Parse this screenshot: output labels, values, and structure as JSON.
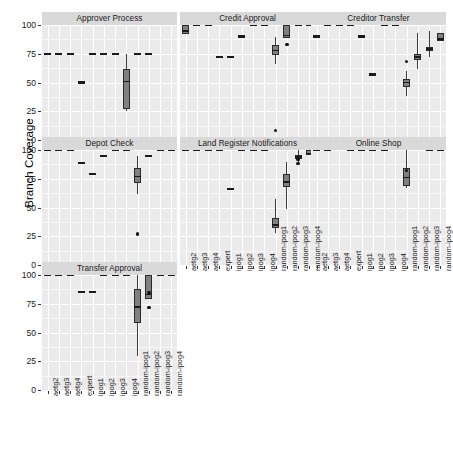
{
  "chart_data": {
    "type": "table",
    "plot_kind": "box",
    "title": "",
    "subtitle": "",
    "xlabel": "",
    "ylabel": "Branch Coverage",
    "ylim": [
      0,
      100
    ],
    "yticks": [
      0,
      25,
      50,
      75,
      100
    ],
    "ytick_labels": [
      "0",
      "25",
      "50",
      "75",
      "100"
    ],
    "grid": true,
    "legend": "none",
    "facet_layout": "3 columns x 3 rows",
    "categories": [
      "aetg2",
      "aetg3",
      "aetg4",
      "expert",
      "ipog1",
      "ipog2",
      "ipog3",
      "ipog4",
      "random-ipog1",
      "random-ipog2",
      "random-ipog3",
      "random-ipog4"
    ],
    "facets": [
      {
        "name": "Approver Process",
        "boxes": [
          {
            "cat": "aetg2",
            "min": 75,
            "q1": 75,
            "med": 75,
            "q3": 75,
            "max": 75,
            "outliers": []
          },
          {
            "cat": "aetg3",
            "min": 75,
            "q1": 75,
            "med": 75,
            "q3": 75,
            "max": 75,
            "outliers": []
          },
          {
            "cat": "aetg4",
            "min": 75,
            "q1": 75,
            "med": 75,
            "q3": 75,
            "max": 75,
            "outliers": []
          },
          {
            "cat": "expert",
            "min": 50,
            "q1": 50,
            "med": 50,
            "q3": 50,
            "max": 50,
            "outliers": []
          },
          {
            "cat": "ipog1",
            "min": 75,
            "q1": 75,
            "med": 75,
            "q3": 75,
            "max": 75,
            "outliers": []
          },
          {
            "cat": "ipog2",
            "min": 75,
            "q1": 75,
            "med": 75,
            "q3": 75,
            "max": 75,
            "outliers": []
          },
          {
            "cat": "ipog3",
            "min": 75,
            "q1": 75,
            "med": 75,
            "q3": 75,
            "max": 75,
            "outliers": []
          },
          {
            "cat": "ipog4",
            "min": 25,
            "q1": 27,
            "med": 51,
            "q3": 62,
            "max": 75,
            "outliers": []
          },
          {
            "cat": "random-ipog1",
            "min": 75,
            "q1": 75,
            "med": 75,
            "q3": 75,
            "max": 75,
            "outliers": []
          },
          {
            "cat": "random-ipog2",
            "min": 75,
            "q1": 75,
            "med": 75,
            "q3": 75,
            "max": 75,
            "outliers": []
          },
          {
            "cat": "random-ipog3",
            "min": null,
            "q1": null,
            "med": null,
            "q3": null,
            "max": null,
            "outliers": []
          },
          {
            "cat": "random-ipog4",
            "min": null,
            "q1": null,
            "med": null,
            "q3": null,
            "max": null,
            "outliers": []
          }
        ]
      },
      {
        "name": "Credit Approval",
        "boxes": [
          {
            "cat": "aetg2",
            "min": 92,
            "q1": 92,
            "med": 95,
            "q3": 100,
            "max": 100,
            "outliers": []
          },
          {
            "cat": "aetg3",
            "min": 100,
            "q1": 100,
            "med": 100,
            "q3": 100,
            "max": 100,
            "outliers": []
          },
          {
            "cat": "aetg4",
            "min": 100,
            "q1": 100,
            "med": 100,
            "q3": 100,
            "max": 100,
            "outliers": []
          },
          {
            "cat": "expert",
            "min": 72,
            "q1": 72,
            "med": 72,
            "q3": 72,
            "max": 72,
            "outliers": []
          },
          {
            "cat": "ipog1",
            "min": 72,
            "q1": 72,
            "med": 72,
            "q3": 72,
            "max": 72,
            "outliers": []
          },
          {
            "cat": "ipog2",
            "min": 90,
            "q1": 90,
            "med": 90,
            "q3": 90,
            "max": 90,
            "outliers": []
          },
          {
            "cat": "ipog3",
            "min": 100,
            "q1": 100,
            "med": 100,
            "q3": 100,
            "max": 100,
            "outliers": []
          },
          {
            "cat": "ipog4",
            "min": 100,
            "q1": 100,
            "med": 100,
            "q3": 100,
            "max": 100,
            "outliers": []
          },
          {
            "cat": "random-ipog1",
            "min": 66,
            "q1": 74,
            "med": 78,
            "q3": 83,
            "max": 90,
            "outliers": [
              8
            ]
          },
          {
            "cat": "random-ipog2",
            "min": 89,
            "q1": 89,
            "med": 91,
            "q3": 100,
            "max": 100,
            "outliers": [
              83
            ]
          },
          {
            "cat": "random-ipog3",
            "min": 100,
            "q1": 100,
            "med": 100,
            "q3": 100,
            "max": 100,
            "outliers": []
          },
          {
            "cat": "random-ipog4",
            "min": 100,
            "q1": 100,
            "med": 100,
            "q3": 100,
            "max": 100,
            "outliers": []
          }
        ]
      },
      {
        "name": "Creditor Transfer",
        "boxes": [
          {
            "cat": "aetg2",
            "min": 90,
            "q1": 90,
            "med": 90,
            "q3": 90,
            "max": 90,
            "outliers": []
          },
          {
            "cat": "aetg3",
            "min": 100,
            "q1": 100,
            "med": 100,
            "q3": 100,
            "max": 100,
            "outliers": []
          },
          {
            "cat": "aetg4",
            "min": 100,
            "q1": 100,
            "med": 100,
            "q3": 100,
            "max": 100,
            "outliers": []
          },
          {
            "cat": "expert",
            "min": 100,
            "q1": 100,
            "med": 100,
            "q3": 100,
            "max": 100,
            "outliers": []
          },
          {
            "cat": "ipog1",
            "min": 90,
            "q1": 90,
            "med": 90,
            "q3": 90,
            "max": 90,
            "outliers": []
          },
          {
            "cat": "ipog2",
            "min": 57,
            "q1": 57,
            "med": 57,
            "q3": 57,
            "max": 57,
            "outliers": []
          },
          {
            "cat": "ipog3",
            "min": 100,
            "q1": 100,
            "med": 100,
            "q3": 100,
            "max": 100,
            "outliers": []
          },
          {
            "cat": "ipog4",
            "min": 100,
            "q1": 100,
            "med": 100,
            "q3": 100,
            "max": 100,
            "outliers": []
          },
          {
            "cat": "random-ipog1",
            "min": 38,
            "q1": 46,
            "med": 50,
            "q3": 53,
            "max": 60,
            "outliers": [
              68
            ]
          },
          {
            "cat": "random-ipog2",
            "min": 62,
            "q1": 70,
            "med": 72,
            "q3": 75,
            "max": 93,
            "outliers": []
          },
          {
            "cat": "random-ipog3",
            "min": 72,
            "q1": 77,
            "med": 79,
            "q3": 81,
            "max": 95,
            "outliers": []
          },
          {
            "cat": "random-ipog4",
            "min": 86,
            "q1": 86,
            "med": 88,
            "q3": 93,
            "max": 93,
            "outliers": []
          }
        ]
      },
      {
        "name": "Depot Check",
        "boxes": [
          {
            "cat": "aetg2",
            "min": 100,
            "q1": 100,
            "med": 100,
            "q3": 100,
            "max": 100,
            "outliers": []
          },
          {
            "cat": "aetg3",
            "min": 100,
            "q1": 100,
            "med": 100,
            "q3": 100,
            "max": 100,
            "outliers": []
          },
          {
            "cat": "aetg4",
            "min": 100,
            "q1": 100,
            "med": 100,
            "q3": 100,
            "max": 100,
            "outliers": []
          },
          {
            "cat": "expert",
            "min": 89,
            "q1": 89,
            "med": 89,
            "q3": 89,
            "max": 89,
            "outliers": []
          },
          {
            "cat": "ipog1",
            "min": 79,
            "q1": 79,
            "med": 79,
            "q3": 79,
            "max": 79,
            "outliers": []
          },
          {
            "cat": "ipog2",
            "min": 95,
            "q1": 95,
            "med": 95,
            "q3": 95,
            "max": 95,
            "outliers": []
          },
          {
            "cat": "ipog3",
            "min": 100,
            "q1": 100,
            "med": 100,
            "q3": 100,
            "max": 100,
            "outliers": []
          },
          {
            "cat": "ipog4",
            "min": 100,
            "q1": 100,
            "med": 100,
            "q3": 100,
            "max": 100,
            "outliers": []
          },
          {
            "cat": "random-ipog1",
            "min": 62,
            "q1": 71,
            "med": 77,
            "q3": 84,
            "max": 95,
            "outliers": [
              27
            ]
          },
          {
            "cat": "random-ipog2",
            "min": 95,
            "q1": 95,
            "med": 95,
            "q3": 95,
            "max": 95,
            "outliers": []
          },
          {
            "cat": "random-ipog3",
            "min": 100,
            "q1": 100,
            "med": 100,
            "q3": 100,
            "max": 100,
            "outliers": []
          },
          {
            "cat": "random-ipog4",
            "min": 100,
            "q1": 100,
            "med": 100,
            "q3": 100,
            "max": 100,
            "outliers": []
          }
        ]
      },
      {
        "name": "Land Register Notifications",
        "boxes": [
          {
            "cat": "aetg2",
            "min": 100,
            "q1": 100,
            "med": 100,
            "q3": 100,
            "max": 100,
            "outliers": []
          },
          {
            "cat": "aetg3",
            "min": 100,
            "q1": 100,
            "med": 100,
            "q3": 100,
            "max": 100,
            "outliers": []
          },
          {
            "cat": "aetg4",
            "min": 100,
            "q1": 100,
            "med": 100,
            "q3": 100,
            "max": 100,
            "outliers": []
          },
          {
            "cat": "expert",
            "min": 100,
            "q1": 100,
            "med": 100,
            "q3": 100,
            "max": 100,
            "outliers": []
          },
          {
            "cat": "ipog1",
            "min": 66,
            "q1": 66,
            "med": 66,
            "q3": 66,
            "max": 66,
            "outliers": []
          },
          {
            "cat": "ipog2",
            "min": 100,
            "q1": 100,
            "med": 100,
            "q3": 100,
            "max": 100,
            "outliers": []
          },
          {
            "cat": "ipog3",
            "min": 100,
            "q1": 100,
            "med": 100,
            "q3": 100,
            "max": 100,
            "outliers": []
          },
          {
            "cat": "ipog4",
            "min": 100,
            "q1": 100,
            "med": 100,
            "q3": 100,
            "max": 100,
            "outliers": []
          },
          {
            "cat": "random-ipog1",
            "min": 28,
            "q1": 32,
            "med": 35,
            "q3": 41,
            "max": 57,
            "outliers": []
          },
          {
            "cat": "random-ipog2",
            "min": 49,
            "q1": 68,
            "med": 72,
            "q3": 79,
            "max": 90,
            "outliers": []
          },
          {
            "cat": "random-ipog3",
            "min": 88,
            "q1": 92,
            "med": 94,
            "q3": 96,
            "max": 100,
            "outliers": [
              88,
              92
            ]
          },
          {
            "cat": "random-ipog4",
            "min": 96,
            "q1": 96,
            "med": 97,
            "q3": 100,
            "max": 100,
            "outliers": []
          }
        ]
      },
      {
        "name": "Online Shop",
        "boxes": [
          {
            "cat": "aetg2",
            "min": 100,
            "q1": 100,
            "med": 100,
            "q3": 100,
            "max": 100,
            "outliers": []
          },
          {
            "cat": "aetg3",
            "min": 100,
            "q1": 100,
            "med": 100,
            "q3": 100,
            "max": 100,
            "outliers": []
          },
          {
            "cat": "aetg4",
            "min": null,
            "q1": null,
            "med": null,
            "q3": null,
            "max": null,
            "outliers": []
          },
          {
            "cat": "expert",
            "min": 100,
            "q1": 100,
            "med": 100,
            "q3": 100,
            "max": 100,
            "outliers": []
          },
          {
            "cat": "ipog1",
            "min": 100,
            "q1": 100,
            "med": 100,
            "q3": 100,
            "max": 100,
            "outliers": []
          },
          {
            "cat": "ipog2",
            "min": 100,
            "q1": 100,
            "med": 100,
            "q3": 100,
            "max": 100,
            "outliers": []
          },
          {
            "cat": "ipog3",
            "min": 100,
            "q1": 100,
            "med": 100,
            "q3": 100,
            "max": 100,
            "outliers": []
          },
          {
            "cat": "ipog4",
            "min": null,
            "q1": null,
            "med": null,
            "q3": null,
            "max": null,
            "outliers": []
          },
          {
            "cat": "random-ipog1",
            "min": 67,
            "q1": 69,
            "med": 76,
            "q3": 84,
            "max": 100,
            "outliers": [
              82
            ]
          },
          {
            "cat": "random-ipog2",
            "min": null,
            "q1": null,
            "med": null,
            "q3": null,
            "max": null,
            "outliers": []
          },
          {
            "cat": "random-ipog3",
            "min": 100,
            "q1": 100,
            "med": 100,
            "q3": 100,
            "max": 100,
            "outliers": []
          },
          {
            "cat": "random-ipog4",
            "min": 100,
            "q1": 100,
            "med": 100,
            "q3": 100,
            "max": 100,
            "outliers": []
          }
        ]
      },
      {
        "name": "Transfer Approval",
        "boxes": [
          {
            "cat": "aetg2",
            "min": 100,
            "q1": 100,
            "med": 100,
            "q3": 100,
            "max": 100,
            "outliers": []
          },
          {
            "cat": "aetg3",
            "min": 100,
            "q1": 100,
            "med": 100,
            "q3": 100,
            "max": 100,
            "outliers": []
          },
          {
            "cat": "aetg4",
            "min": 100,
            "q1": 100,
            "med": 100,
            "q3": 100,
            "max": 100,
            "outliers": []
          },
          {
            "cat": "expert",
            "min": 85,
            "q1": 85,
            "med": 85,
            "q3": 85,
            "max": 85,
            "outliers": []
          },
          {
            "cat": "ipog1",
            "min": 85,
            "q1": 85,
            "med": 85,
            "q3": 85,
            "max": 85,
            "outliers": []
          },
          {
            "cat": "ipog2",
            "min": 100,
            "q1": 100,
            "med": 100,
            "q3": 100,
            "max": 100,
            "outliers": []
          },
          {
            "cat": "ipog3",
            "min": 100,
            "q1": 100,
            "med": 100,
            "q3": 100,
            "max": 100,
            "outliers": []
          },
          {
            "cat": "ipog4",
            "min": 100,
            "q1": 100,
            "med": 100,
            "q3": 100,
            "max": 100,
            "outliers": []
          },
          {
            "cat": "random-ipog1",
            "min": 30,
            "q1": 58,
            "med": 72,
            "q3": 88,
            "max": 100,
            "outliers": []
          },
          {
            "cat": "random-ipog2",
            "min": 79,
            "q1": 79,
            "med": 83,
            "q3": 100,
            "max": 100,
            "outliers": [
              85,
              72
            ]
          },
          {
            "cat": "random-ipog3",
            "min": 100,
            "q1": 100,
            "med": 100,
            "q3": 100,
            "max": 100,
            "outliers": []
          },
          {
            "cat": "random-ipog4",
            "min": 100,
            "q1": 100,
            "med": 100,
            "q3": 100,
            "max": 100,
            "outliers": []
          }
        ]
      }
    ]
  },
  "style": {
    "strip_bg": "#d9d9d9",
    "panel_bg": "#ebebeb",
    "grid_color": "#ffffff",
    "box_fill": "#808080",
    "box_stroke": "#2b2b2b",
    "median_color": "#1a1a1a",
    "point_color": "#111111",
    "text_color": "#1a1a1a"
  }
}
